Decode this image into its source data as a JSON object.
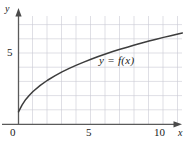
{
  "chart_data": {
    "type": "line",
    "title": "",
    "subtitle": "",
    "xlabel": "x",
    "ylabel": "y",
    "xlim": [
      0,
      11.3
    ],
    "ylim": [
      0,
      7.8
    ],
    "grid": true,
    "grid_spacing": 1,
    "legend": "none",
    "annotations": [
      {
        "name": "curve-label",
        "text": "y = f(x)",
        "x": 5.7,
        "y": 5.0
      }
    ],
    "xticks": [
      {
        "value": 0,
        "label": "0"
      },
      {
        "value": 5,
        "label": "5"
      },
      {
        "value": 10,
        "label": "10"
      }
    ],
    "yticks": [
      {
        "value": 5,
        "label": "5"
      }
    ],
    "series": [
      {
        "name": "f",
        "label": "y = f(x)",
        "color": "#3d3d3d",
        "x": [
          0.0,
          0.25,
          0.5,
          0.75,
          1.0,
          1.5,
          2.0,
          2.5,
          3.0,
          3.5,
          4.0,
          4.5,
          5.0,
          5.5,
          6.0,
          6.5,
          7.0,
          7.5,
          8.0,
          8.5,
          9.0,
          9.5,
          10.0,
          10.5,
          11.0,
          11.3
        ],
        "y": [
          0.85,
          1.35,
          1.73,
          2.03,
          2.29,
          2.72,
          3.08,
          3.39,
          3.67,
          3.92,
          4.15,
          4.36,
          4.56,
          4.75,
          4.93,
          5.1,
          5.26,
          5.41,
          5.56,
          5.7,
          5.84,
          5.97,
          6.1,
          6.22,
          6.34,
          6.41
        ]
      }
    ]
  },
  "labels": {
    "y_axis": "y",
    "x_axis": "x",
    "ytick_5": "5",
    "xtick_0": "0",
    "xtick_5": "5",
    "xtick_10": "10",
    "curve": "y = f(x)"
  },
  "colors": {
    "curve": "#3d3d3d",
    "axis": "#5a5a5a",
    "grid": "#c9c9d4",
    "text": "#1a1a1a",
    "background": "#ffffff"
  }
}
